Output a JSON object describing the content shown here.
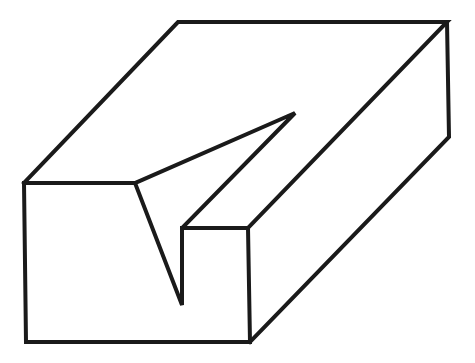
{
  "figure": {
    "stroke_color": "#1a1a1a",
    "background": "#ffffff",
    "stroke_width": 4
  }
}
